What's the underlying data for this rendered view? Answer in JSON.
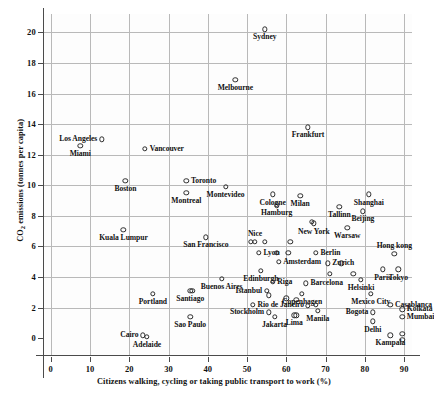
{
  "chart_data": {
    "type": "scatter",
    "title": "",
    "xlabel": "Citizens walking, cycling or taking public transport to work (%)",
    "ylabel": "CO2 emissions (tonnes per capita)",
    "xlim": [
      -2,
      92
    ],
    "ylim": [
      -1.1,
      21.2
    ],
    "xticks": [
      0,
      10,
      20,
      30,
      40,
      50,
      60,
      70,
      80,
      90
    ],
    "yticks": [
      0,
      2,
      4,
      6,
      8,
      10,
      12,
      14,
      16,
      18,
      20
    ],
    "grid": true,
    "legend": "none",
    "marker": "open-circle",
    "points": [
      {
        "name": "Sydney",
        "x": 54.5,
        "y": 20.2,
        "pos": "below"
      },
      {
        "name": "Melbourne",
        "x": 47.0,
        "y": 16.9,
        "pos": "below"
      },
      {
        "name": "Frankfurt",
        "x": 65.5,
        "y": 13.8,
        "pos": "below"
      },
      {
        "name": "Los Angeles",
        "x": 13.0,
        "y": 13.0,
        "pos": "left"
      },
      {
        "name": "Miami",
        "x": 7.5,
        "y": 12.6,
        "pos": "below"
      },
      {
        "name": "Vancouver",
        "x": 24.0,
        "y": 12.4,
        "pos": "right"
      },
      {
        "name": "Toronto",
        "x": 34.5,
        "y": 10.3,
        "pos": "right"
      },
      {
        "name": "Boston",
        "x": 19.0,
        "y": 10.3,
        "pos": "below"
      },
      {
        "name": "Montreal",
        "x": 34.5,
        "y": 9.5,
        "pos": "below"
      },
      {
        "name": "Montevideo",
        "x": 44.5,
        "y": 9.9,
        "pos": "below"
      },
      {
        "name": "Cologne",
        "x": 56.5,
        "y": 9.4,
        "pos": "below"
      },
      {
        "name": "Milan",
        "x": 63.5,
        "y": 9.3,
        "pos": "below"
      },
      {
        "name": "Shanghai",
        "x": 81.0,
        "y": 9.4,
        "pos": "below"
      },
      {
        "name": "Hamburg",
        "x": 57.5,
        "y": 8.7,
        "pos": "below"
      },
      {
        "name": "Tallinn",
        "x": 73.5,
        "y": 8.6,
        "pos": "below"
      },
      {
        "name": "Beijing",
        "x": 79.5,
        "y": 8.3,
        "pos": "below"
      },
      {
        "name": "Kuala Lumpur",
        "x": 18.5,
        "y": 7.1,
        "pos": "below"
      },
      {
        "name": "New York",
        "x": 67.0,
        "y": 7.5,
        "pos": "below"
      },
      {
        "name": "Warsaw",
        "x": 75.5,
        "y": 7.2,
        "pos": "below"
      },
      {
        "name": "San Francisco",
        "x": 39.5,
        "y": 6.6,
        "pos": "below"
      },
      {
        "name": "Nice",
        "x": 52.0,
        "y": 6.3,
        "pos": "above"
      },
      {
        "name": "Lyon",
        "x": 53.0,
        "y": 5.6,
        "pos": "right"
      },
      {
        "name": "Berlin",
        "x": 67.5,
        "y": 5.6,
        "pos": "right"
      },
      {
        "name": "Hong kong",
        "x": 87.5,
        "y": 5.5,
        "pos": "above"
      },
      {
        "name": "Amsterdam",
        "x": 58.0,
        "y": 5.0,
        "pos": "right"
      },
      {
        "name": "Zurich",
        "x": 70.5,
        "y": 4.9,
        "pos": "right"
      },
      {
        "name": "Paris",
        "x": 84.5,
        "y": 4.5,
        "pos": "below"
      },
      {
        "name": "Tokyo",
        "x": 88.5,
        "y": 4.5,
        "pos": "below"
      },
      {
        "name": "Edinburgh",
        "x": 53.5,
        "y": 4.4,
        "pos": "below"
      },
      {
        "name": "Buenos Aires",
        "x": 43.5,
        "y": 3.9,
        "pos": "below"
      },
      {
        "name": "Riga",
        "x": 56.5,
        "y": 3.7,
        "pos": "right"
      },
      {
        "name": "Barcelona",
        "x": 65.0,
        "y": 3.6,
        "pos": "right"
      },
      {
        "name": "Helsinki",
        "x": 79.0,
        "y": 3.8,
        "pos": "below"
      },
      {
        "name": "Istanbul",
        "x": 55.0,
        "y": 3.1,
        "pos": "left"
      },
      {
        "name": "Copenhagen",
        "x": 64.0,
        "y": 2.9,
        "pos": "below"
      },
      {
        "name": "Santiago",
        "x": 35.5,
        "y": 3.1,
        "pos": "below"
      },
      {
        "name": "Portland",
        "x": 26.0,
        "y": 2.9,
        "pos": "below"
      },
      {
        "name": "Mexico City",
        "x": 81.5,
        "y": 2.9,
        "pos": "below"
      },
      {
        "name": "Rio de Janeiro",
        "x": 51.5,
        "y": 2.2,
        "pos": "right"
      },
      {
        "name": "Casablanca",
        "x": 86.5,
        "y": 2.2,
        "pos": "right"
      },
      {
        "name": "Kolkata",
        "x": 89.5,
        "y": 1.9,
        "pos": "right"
      },
      {
        "name": "Stockholm",
        "x": 55.5,
        "y": 1.7,
        "pos": "left"
      },
      {
        "name": "Bogota",
        "x": 82.0,
        "y": 1.7,
        "pos": "left"
      },
      {
        "name": "Manila",
        "x": 68.0,
        "y": 1.8,
        "pos": "below"
      },
      {
        "name": "Mumbai",
        "x": 89.5,
        "y": 1.4,
        "pos": "right"
      },
      {
        "name": "Sao Paulo",
        "x": 35.5,
        "y": 1.4,
        "pos": "below"
      },
      {
        "name": "Jakarta",
        "x": 57.0,
        "y": 1.4,
        "pos": "below"
      },
      {
        "name": "Lima",
        "x": 62.0,
        "y": 1.5,
        "pos": "below"
      },
      {
        "name": "Delhi",
        "x": 82.0,
        "y": 1.1,
        "pos": "below"
      },
      {
        "name": "Cairo",
        "x": 23.5,
        "y": 0.2,
        "pos": "left"
      },
      {
        "name": "Adelaide",
        "x": 24.5,
        "y": 0.1,
        "pos": "below"
      },
      {
        "name": "Kampala",
        "x": 86.5,
        "y": 0.2,
        "pos": "below"
      },
      {
        "name": "",
        "x": 89.5,
        "y": 0.3,
        "pos": "none"
      },
      {
        "name": "",
        "x": 89.5,
        "y": -0.1,
        "pos": "none"
      },
      {
        "name": "",
        "x": 66.5,
        "y": 7.6,
        "pos": "none"
      },
      {
        "name": "",
        "x": 51.0,
        "y": 6.3,
        "pos": "none"
      },
      {
        "name": "",
        "x": 54.5,
        "y": 6.3,
        "pos": "none"
      },
      {
        "name": "",
        "x": 61.0,
        "y": 6.3,
        "pos": "none"
      },
      {
        "name": "",
        "x": 57.5,
        "y": 5.6,
        "pos": "none"
      },
      {
        "name": "",
        "x": 60.5,
        "y": 5.6,
        "pos": "none"
      },
      {
        "name": "",
        "x": 74.0,
        "y": 4.9,
        "pos": "none"
      },
      {
        "name": "",
        "x": 77.0,
        "y": 4.2,
        "pos": "none"
      },
      {
        "name": "",
        "x": 71.0,
        "y": 4.2,
        "pos": "none"
      },
      {
        "name": "",
        "x": 55.5,
        "y": 2.8,
        "pos": "none"
      },
      {
        "name": "",
        "x": 60.0,
        "y": 2.6,
        "pos": "none"
      },
      {
        "name": "",
        "x": 62.5,
        "y": 2.5,
        "pos": "none"
      },
      {
        "name": "",
        "x": 65.5,
        "y": 2.1,
        "pos": "none"
      },
      {
        "name": "",
        "x": 67.5,
        "y": 2.2,
        "pos": "none"
      },
      {
        "name": "",
        "x": 62.5,
        "y": 1.5,
        "pos": "none"
      },
      {
        "name": "",
        "x": 36.0,
        "y": 3.1,
        "pos": "none"
      }
    ]
  }
}
